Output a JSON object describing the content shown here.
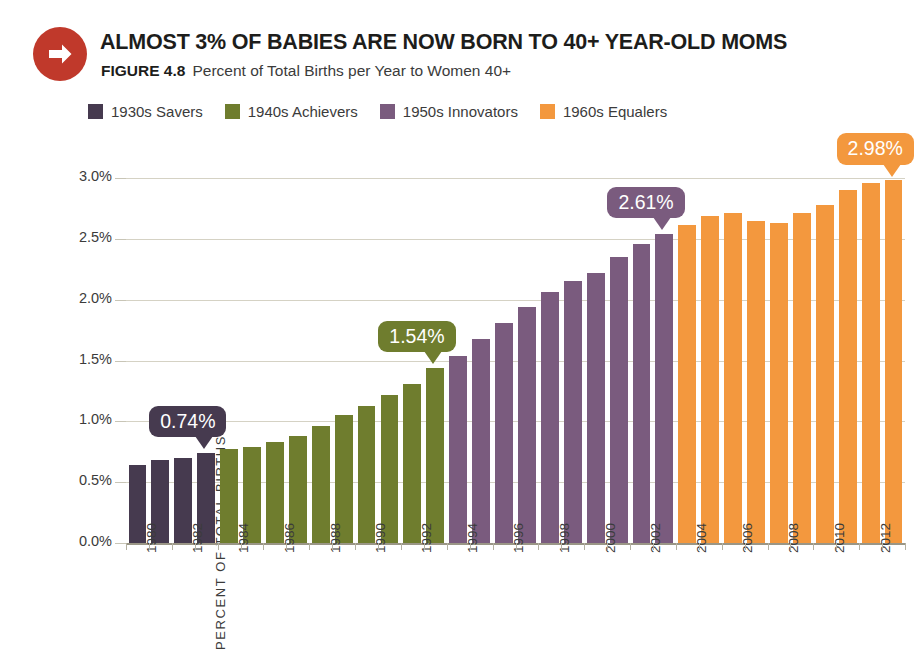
{
  "header": {
    "icon": "arrow-right-circle-icon",
    "title": "ALMOST 3% OF BABIES ARE NOW BORN TO 40+ YEAR-OLD MOMS",
    "figure_number": "FIGURE 4.8",
    "figure_caption": "Percent of Total Births per Year to Women 40+"
  },
  "colors": {
    "savers_1930s": "#463a4f",
    "achievers_1940s": "#6f7d2e",
    "innovators_1950s": "#7a5b7e",
    "equalers_1960s": "#f3983e",
    "icon_red": "#c0392b",
    "gridline": "#d5d2c4",
    "text": "#3b3b3b"
  },
  "legend": {
    "position": "top-left",
    "items": [
      {
        "label": "1930s Savers",
        "color": "#463a4f"
      },
      {
        "label": "1940s Achievers",
        "color": "#6f7d2e"
      },
      {
        "label": "1950s Innovators",
        "color": "#7a5b7e"
      },
      {
        "label": "1960s Equalers",
        "color": "#f3983e"
      }
    ]
  },
  "callouts": [
    {
      "label": "0.74%",
      "color": "#463a4f",
      "year": 1983
    },
    {
      "label": "1.54%",
      "color": "#6f7d2e",
      "year": 1993
    },
    {
      "label": "2.61%",
      "color": "#7a5b7e",
      "year": 2003
    },
    {
      "label": "2.98%",
      "color": "#f3983e",
      "year": 2013
    }
  ],
  "chart_data": {
    "type": "bar",
    "title": "ALMOST 3% OF BABIES ARE NOW BORN TO 40+ YEAR-OLD MOMS",
    "subtitle": "FIGURE 4.8  Percent of Total Births per Year to Women 40+",
    "xlabel": "",
    "ylabel": "PERCENT OF TOTAL BIRTHS",
    "ylim": [
      0.0,
      3.0
    ],
    "yticks": [
      0.0,
      0.5,
      1.0,
      1.5,
      2.0,
      2.5,
      3.0
    ],
    "ytick_labels": [
      "0.0%",
      "0.5%",
      "1.0%",
      "1.5%",
      "2.0%",
      "2.5%",
      "3.0%"
    ],
    "grid": true,
    "legend_position": "top-left",
    "categories": [
      "1980",
      "1981",
      "1982",
      "1983",
      "1984",
      "1985",
      "1986",
      "1987",
      "1988",
      "1989",
      "1990",
      "1991",
      "1992",
      "1993",
      "1994",
      "1995",
      "1996",
      "1997",
      "1998",
      "1999",
      "2000",
      "2001",
      "2002",
      "2003",
      "2004",
      "2005",
      "2006",
      "2007",
      "2008",
      "2009",
      "2010",
      "2011",
      "2012",
      "2013"
    ],
    "xtick_labels_shown": [
      "1980",
      "1982",
      "1984",
      "1986",
      "1988",
      "1990",
      "1992",
      "1994",
      "1996",
      "1998",
      "2000",
      "2002",
      "2004",
      "2006",
      "2008",
      "2010",
      "2012"
    ],
    "values": [
      0.64,
      0.68,
      0.7,
      0.74,
      0.77,
      0.79,
      0.83,
      0.88,
      0.96,
      1.05,
      1.13,
      1.22,
      1.31,
      1.44,
      1.54,
      1.68,
      1.81,
      1.94,
      2.06,
      2.15,
      2.22,
      2.35,
      2.46,
      2.54,
      2.61,
      2.69,
      2.71,
      2.65,
      2.63,
      2.71,
      2.78,
      2.9,
      2.96,
      2.98
    ],
    "group_colors": [
      "#463a4f",
      "#463a4f",
      "#463a4f",
      "#463a4f",
      "#6f7d2e",
      "#6f7d2e",
      "#6f7d2e",
      "#6f7d2e",
      "#6f7d2e",
      "#6f7d2e",
      "#6f7d2e",
      "#6f7d2e",
      "#6f7d2e",
      "#6f7d2e",
      "#7a5b7e",
      "#7a5b7e",
      "#7a5b7e",
      "#7a5b7e",
      "#7a5b7e",
      "#7a5b7e",
      "#7a5b7e",
      "#7a5b7e",
      "#7a5b7e",
      "#7a5b7e",
      "#f3983e",
      "#f3983e",
      "#f3983e",
      "#f3983e",
      "#f3983e",
      "#f3983e",
      "#f3983e",
      "#f3983e",
      "#f3983e",
      "#f3983e"
    ],
    "series_groups": [
      {
        "name": "1930s Savers",
        "color": "#463a4f",
        "years": [
          1980,
          1983
        ]
      },
      {
        "name": "1940s Achievers",
        "color": "#6f7d2e",
        "years": [
          1984,
          1993
        ]
      },
      {
        "name": "1950s Innovators",
        "color": "#7a5b7e",
        "years": [
          1994,
          2003
        ]
      },
      {
        "name": "1960s Equalers",
        "color": "#f3983e",
        "years": [
          2004,
          2013
        ]
      }
    ]
  }
}
